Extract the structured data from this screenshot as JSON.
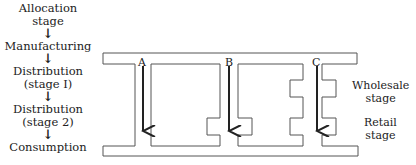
{
  "flow": {
    "stages": [
      "Allocation\nstage",
      "Manufacturing",
      "Distribution\n(stage I)",
      "Distribution\n(stage 2)",
      "Consumption"
    ],
    "arrow_glyph": "↓"
  },
  "channels": {
    "A": "A",
    "B": "B",
    "C": "C"
  },
  "labels": {
    "wholesale": "Wholesale\nstage",
    "retail": "Retail\nstage"
  }
}
